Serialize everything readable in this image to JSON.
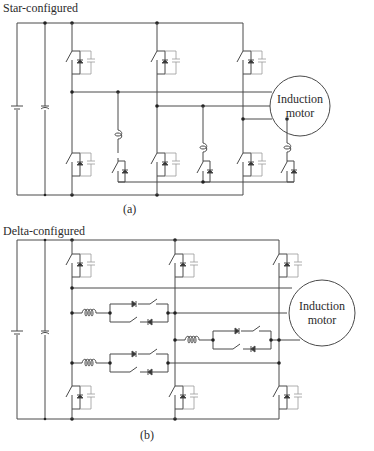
{
  "figure_a": {
    "title": "Star-configured",
    "caption": "(a)",
    "motor_label_line1": "Induction",
    "motor_label_line2": "motor",
    "legs": 3,
    "auxiliary_branches": 3
  },
  "figure_b": {
    "title": "Delta-configured",
    "caption": "(b)",
    "motor_label_line1": "Induction",
    "motor_label_line2": "motor",
    "legs": 3,
    "auxiliary_branches": 3
  },
  "components": {
    "source": "dc-battery",
    "dc_link": "capacitor",
    "main_switch": "switch-with-antiparallel-diode-and-snubber-capacitor",
    "aux_inductor": "inductor",
    "aux_switch": "bidirectional-switch-with-diodes"
  },
  "colors": {
    "wire": "#4a4a4a",
    "snubber": "#9a9a9a",
    "background": "#ffffff"
  }
}
